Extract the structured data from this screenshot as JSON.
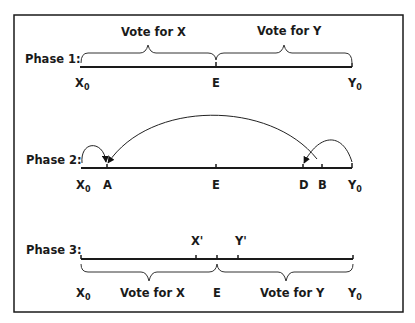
{
  "diagram": {
    "phases": [
      {
        "label": "Phase 1:",
        "brace_labels": [
          "Vote for X",
          "Vote for Y"
        ],
        "points": [
          {
            "name": "X",
            "sub": "0"
          },
          {
            "name": "E",
            "sub": ""
          },
          {
            "name": "Y",
            "sub": "0"
          }
        ]
      },
      {
        "label": "Phase 2:",
        "points": [
          {
            "name": "X",
            "sub": "0"
          },
          {
            "name": "A",
            "sub": ""
          },
          {
            "name": "E",
            "sub": ""
          },
          {
            "name": "D",
            "sub": ""
          },
          {
            "name": "B",
            "sub": ""
          },
          {
            "name": "Y",
            "sub": "0"
          }
        ],
        "arrows": [
          {
            "from": "X0",
            "to": "A"
          },
          {
            "from": "D",
            "to": "A"
          },
          {
            "from": "Y0",
            "to": "D"
          }
        ]
      },
      {
        "label": "Phase 3:",
        "above_points": [
          {
            "name": "X'"
          },
          {
            "name": "Y'"
          }
        ],
        "brace_labels": [
          "Vote for X",
          "Vote for Y"
        ],
        "points": [
          {
            "name": "X",
            "sub": "0"
          },
          {
            "name": "E",
            "sub": ""
          },
          {
            "name": "Y",
            "sub": "0"
          }
        ]
      }
    ]
  }
}
